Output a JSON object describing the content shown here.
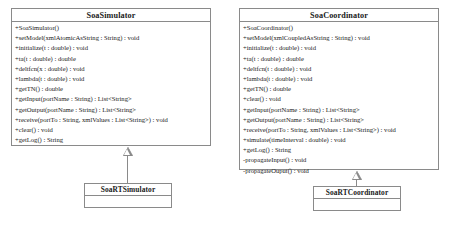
{
  "diagram": {
    "type": "uml-class-diagram",
    "classes": [
      {
        "id": "soasimulator",
        "name": "SoaSimulator",
        "members": [
          "+SoaSimulator()",
          "+setModel(xmlAtomicAsString : String) : void",
          "+initialize(t : double) : void",
          "+ta(t : double) : double",
          "+deltfcn(x : double) : void",
          "+lambda(t : double) : void",
          "+getTN() : double",
          "+getInput(portName : String) : List<String>",
          "+getOutput(portName : String) : List<String>",
          "+receive(portTo : String, xmlValues : List<String>) : void",
          "+clear() : void",
          "+getLog() : String"
        ]
      },
      {
        "id": "soacoordinator",
        "name": "SoaCoordinator",
        "members": [
          "+SoaCoordinator()",
          "+setModel(xmlCoupledAsString : String) : void",
          "+initialize(t : double) : void",
          "+ta(t : double) : double",
          "+deltfcn(t : double) : void",
          "+lambda(t : double) : void",
          "+getTN() : double",
          "+clear() : void",
          "+getInput(portName : String) : List<String>",
          "+getOutput(portName : String) : List<String>",
          "+receive(portTo : String, xmlValues : List<String>) : void",
          "+simulate(timeInterval : double) : void",
          "+getLog() : String",
          "-propagateInput() : void",
          "-propagateOuput() : void"
        ]
      },
      {
        "id": "soartsimulator",
        "name": "SoaRTSimulator",
        "members": []
      },
      {
        "id": "soartcoordinator",
        "name": "SoaRTCoordinator",
        "members": []
      }
    ],
    "relationships": [
      {
        "type": "generalization",
        "child": "SoaRTSimulator",
        "parent": "SoaSimulator",
        "arrow": "hollow-triangle"
      },
      {
        "type": "generalization",
        "child": "SoaRTCoordinator",
        "parent": "SoaCoordinator",
        "arrow": "hollow-triangle"
      }
    ]
  },
  "colors": {
    "border": "#8a8a8a",
    "text": "#1a1a1a",
    "background": "#ffffff"
  }
}
